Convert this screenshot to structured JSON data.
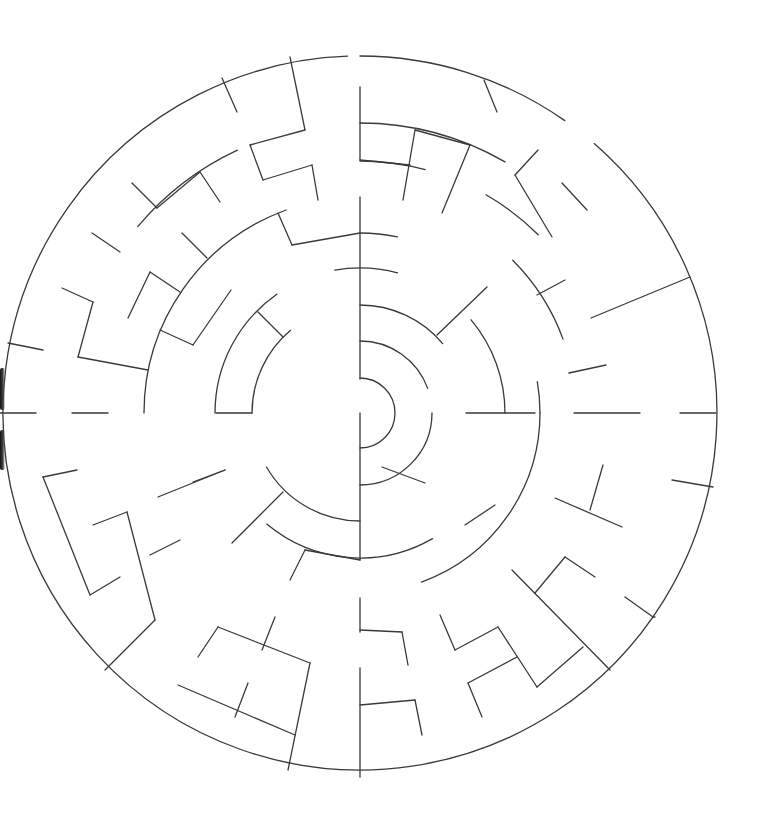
{
  "maze": {
    "type": "circular-maze",
    "center": [
      360,
      413
    ],
    "stroke_color": "#3a3a3a",
    "background": "#ffffff",
    "ring_radii": [
      35,
      72,
      108,
      145,
      180,
      216,
      252,
      290,
      357
    ],
    "arcs": [
      {
        "r": 357,
        "from": -90,
        "to": -55
      },
      {
        "r": 357,
        "from": -49,
        "to": 268
      },
      {
        "r": 290,
        "from": -90,
        "to": -60
      },
      {
        "r": 290,
        "from": -140,
        "to": -115
      },
      {
        "r": 252,
        "from": -90,
        "to": -75
      },
      {
        "r": 252,
        "from": -60,
        "to": -45
      },
      {
        "r": 216,
        "from": -45,
        "to": -20
      },
      {
        "r": 216,
        "from": 180,
        "to": 250
      },
      {
        "r": 180,
        "from": -90,
        "to": -78
      },
      {
        "r": 180,
        "from": -10,
        "to": 0
      },
      {
        "r": 180,
        "from": 0,
        "to": 70
      },
      {
        "r": 145,
        "from": -100,
        "to": -75
      },
      {
        "r": 145,
        "from": -40,
        "to": 0
      },
      {
        "r": 145,
        "from": 60,
        "to": 130
      },
      {
        "r": 145,
        "from": 180,
        "to": 235
      },
      {
        "r": 108,
        "from": -90,
        "to": -40
      },
      {
        "r": 108,
        "from": 90,
        "to": 150
      },
      {
        "r": 108,
        "from": 180,
        "to": 230
      },
      {
        "r": 72,
        "from": -90,
        "to": -20
      },
      {
        "r": 72,
        "from": 0,
        "to": 90
      },
      {
        "r": 35,
        "from": -90,
        "to": 90
      }
    ],
    "walls": [
      [
        360,
        50,
        360,
        50
      ],
      [
        360,
        87,
        360,
        160
      ],
      [
        360,
        197,
        360,
        379
      ],
      [
        360,
        413,
        360,
        560
      ],
      [
        360,
        598,
        360,
        632
      ],
      [
        360,
        668,
        360,
        777
      ],
      [
        290,
        57,
        305,
        130
      ],
      [
        222,
        78,
        237,
        112
      ],
      [
        250,
        145,
        305,
        130
      ],
      [
        263,
        180,
        250,
        145
      ],
      [
        263,
        180,
        312,
        165
      ],
      [
        312,
        165,
        318,
        200
      ],
      [
        278,
        213,
        292,
        245
      ],
      [
        292,
        245,
        360,
        233
      ],
      [
        132,
        183,
        157,
        208
      ],
      [
        157,
        208,
        200,
        172
      ],
      [
        200,
        172,
        220,
        202
      ],
      [
        92,
        233,
        120,
        252
      ],
      [
        182,
        233,
        207,
        258
      ],
      [
        62,
        288,
        93,
        302
      ],
      [
        93,
        302,
        78,
        357
      ],
      [
        78,
        357,
        148,
        370
      ],
      [
        150,
        272,
        180,
        292
      ],
      [
        128,
        318,
        150,
        272
      ],
      [
        160,
        330,
        193,
        345
      ],
      [
        193,
        345,
        231,
        290
      ],
      [
        258,
        312,
        283,
        337
      ],
      [
        8,
        343,
        43,
        350
      ],
      [
        0,
        413,
        36,
        413
      ],
      [
        72,
        413,
        108,
        413
      ],
      [
        216,
        413,
        252,
        413
      ],
      [
        466,
        413,
        535,
        413
      ],
      [
        574,
        413,
        640,
        413
      ],
      [
        680,
        413,
        716,
        413
      ],
      [
        360,
        160,
        410,
        165
      ],
      [
        403,
        200,
        415,
        130
      ],
      [
        415,
        130,
        470,
        145
      ],
      [
        470,
        145,
        442,
        213
      ],
      [
        484,
        80,
        497,
        112
      ],
      [
        538,
        150,
        515,
        175
      ],
      [
        515,
        175,
        552,
        237
      ],
      [
        562,
        183,
        587,
        210
      ],
      [
        591,
        318,
        690,
        277
      ],
      [
        569,
        373,
        606,
        365
      ],
      [
        537,
        295,
        565,
        280
      ],
      [
        432,
        50,
        432,
        50
      ],
      [
        437,
        335,
        487,
        287
      ],
      [
        360,
        490,
        360,
        490
      ],
      [
        360,
        560,
        360,
        560
      ],
      [
        43,
        477,
        77,
        470
      ],
      [
        43,
        477,
        90,
        595
      ],
      [
        90,
        595,
        120,
        577
      ],
      [
        93,
        525,
        127,
        512
      ],
      [
        127,
        512,
        155,
        620
      ],
      [
        155,
        620,
        105,
        670
      ],
      [
        158,
        497,
        225,
        470
      ],
      [
        193,
        482,
        225,
        470
      ],
      [
        150,
        555,
        180,
        540
      ],
      [
        232,
        543,
        283,
        492
      ],
      [
        290,
        580,
        305,
        550
      ],
      [
        305,
        550,
        360,
        560
      ],
      [
        198,
        657,
        218,
        627
      ],
      [
        218,
        627,
        310,
        663
      ],
      [
        310,
        663,
        288,
        770
      ],
      [
        262,
        650,
        275,
        617
      ],
      [
        235,
        717,
        248,
        683
      ],
      [
        178,
        685,
        295,
        735
      ],
      [
        360,
        630,
        402,
        632
      ],
      [
        402,
        632,
        408,
        665
      ],
      [
        360,
        705,
        415,
        700
      ],
      [
        415,
        700,
        422,
        735
      ],
      [
        382,
        467,
        425,
        483
      ],
      [
        465,
        525,
        495,
        505
      ],
      [
        440,
        615,
        455,
        650
      ],
      [
        455,
        650,
        498,
        627
      ],
      [
        498,
        627,
        537,
        687
      ],
      [
        537,
        687,
        583,
        647
      ],
      [
        468,
        683,
        517,
        657
      ],
      [
        468,
        683,
        482,
        717
      ],
      [
        512,
        570,
        610,
        670
      ],
      [
        535,
        593,
        565,
        557
      ],
      [
        565,
        557,
        595,
        577
      ],
      [
        555,
        498,
        622,
        527
      ],
      [
        590,
        510,
        603,
        465
      ],
      [
        625,
        597,
        653,
        617
      ],
      [
        672,
        480,
        713,
        487
      ],
      [
        653,
        617,
        655,
        617
      ]
    ]
  }
}
